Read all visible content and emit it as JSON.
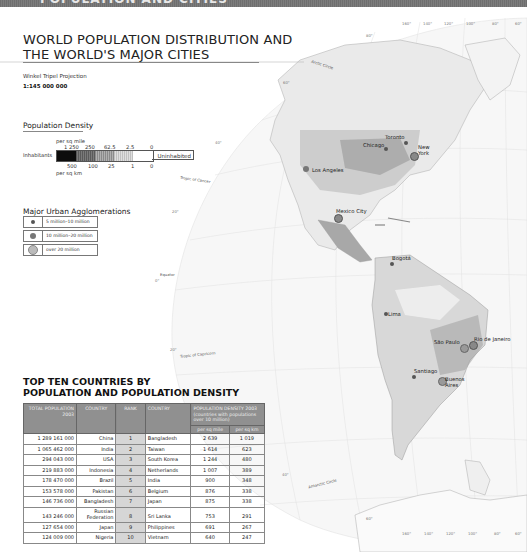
{
  "header": {
    "section_title": "POPULATION AND CITIES"
  },
  "title": {
    "line1": "WORLD POPULATION DISTRIBUTION AND",
    "line2": "THE WORLD'S MAJOR CITIES"
  },
  "projection": "Winkel Tripel Projection",
  "scale": "1:145 000 000",
  "population_density": {
    "title": "Population Density",
    "top_unit": "per sq mile",
    "bottom_unit": "per sq km",
    "left_label": "Inhabitants",
    "right_label": "Uninhabited",
    "top_values": [
      "1 250",
      "250",
      "62.5",
      "2.5",
      "0"
    ],
    "bottom_values": [
      "500",
      "100",
      "25",
      "1",
      "0"
    ],
    "swatches": [
      "#0d0d0d",
      "#6a6a6a",
      "#9a9a9a",
      "#c8c8c8",
      "#ffffff"
    ]
  },
  "urban": {
    "title": "Major Urban Agglomerations",
    "items": [
      {
        "label": "5 million–10 million",
        "size": 4,
        "color": "#555555"
      },
      {
        "label": "10 million–20 million",
        "size": 6,
        "color": "#777777"
      },
      {
        "label": "over 20 million",
        "size": 8,
        "color": "#bbbbbb"
      }
    ]
  },
  "map_labels": {
    "arctic_circle": "Arctic Circle",
    "tropic_cancer": "Tropic of Cancer",
    "equator": "Equator",
    "tropic_capricorn": "Tropic of Capricorn",
    "antarctic_circle": "Antarctic Circle",
    "cities": [
      "Toronto",
      "Chicago",
      "New York",
      "Los Angeles",
      "Mexico City",
      "Bogotá",
      "Lima",
      "São Paulo",
      "Rio de Janeiro",
      "Santiago",
      "Buenos Aires"
    ],
    "top_degrees": [
      "160°",
      "140°",
      "120°",
      "100°",
      "80°",
      "60°"
    ],
    "bottom_degrees": [
      "160°",
      "140°",
      "120°",
      "100°",
      "80°",
      "60°"
    ],
    "lat_degrees": [
      "80°",
      "60°",
      "40°",
      "20°",
      "0°",
      "20°",
      "40°",
      "60°"
    ]
  },
  "top_ten": {
    "title_line1": "TOP TEN COUNTRIES BY",
    "title_line2": "POPULATION AND POPULATION DENSITY",
    "headers": {
      "total_population": "TOTAL POPULATION 2003",
      "country": "COUNTRY",
      "rank": "RANK",
      "country2": "COUNTRY",
      "density": "POPULATION DENSITY 2003 (countries with populations over 10 million)",
      "per_sq_mile": "per sq mile",
      "per_sq_km": "per sq km"
    },
    "rows": [
      {
        "pop": "1 289 161 000",
        "country": "China",
        "rank": "1",
        "dcountry": "Bangladesh",
        "mile": "2 639",
        "km": "1 019"
      },
      {
        "pop": "1 065 462 000",
        "country": "India",
        "rank": "2",
        "dcountry": "Taiwan",
        "mile": "1 614",
        "km": "623"
      },
      {
        "pop": "294 043 000",
        "country": "USA",
        "rank": "3",
        "dcountry": "South Korea",
        "mile": "1 244",
        "km": "480"
      },
      {
        "pop": "219 883 000",
        "country": "Indonesia",
        "rank": "4",
        "dcountry": "Netherlands",
        "mile": "1 007",
        "km": "389"
      },
      {
        "pop": "178 470 000",
        "country": "Brazil",
        "rank": "5",
        "dcountry": "India",
        "mile": "900",
        "km": "348"
      },
      {
        "pop": "153 578 000",
        "country": "Pakistan",
        "rank": "6",
        "dcountry": "Belgium",
        "mile": "876",
        "km": "338"
      },
      {
        "pop": "146 736 000",
        "country": "Bangladesh",
        "rank": "7",
        "dcountry": "Japan",
        "mile": "875",
        "km": "338"
      },
      {
        "pop": "143 246 000",
        "country": "Russian Federation",
        "rank": "8",
        "dcountry": "Sri Lanka",
        "mile": "753",
        "km": "291"
      },
      {
        "pop": "127 654 000",
        "country": "Japan",
        "rank": "9",
        "dcountry": "Philippines",
        "mile": "691",
        "km": "267"
      },
      {
        "pop": "124 009 000",
        "country": "Nigeria",
        "rank": "10",
        "dcountry": "Vietnam",
        "mile": "640",
        "km": "247"
      }
    ]
  }
}
